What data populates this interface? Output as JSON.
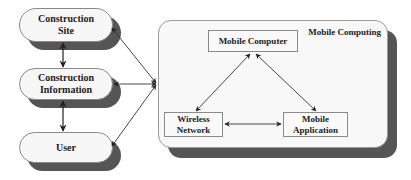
{
  "left_column": {
    "construction_site": {
      "line1": "Construction",
      "line2": "Site"
    },
    "construction_information": {
      "line1": "Construction",
      "line2": "Information"
    },
    "user": {
      "line1": "User"
    }
  },
  "mobile_computing": {
    "title": "Mobile Computing",
    "mobile_computer": {
      "label": "Mobile Computer"
    },
    "wireless_network": {
      "line1": "Wireless",
      "line2": "Network"
    },
    "mobile_application": {
      "line1": "Mobile",
      "line2": "Application"
    }
  },
  "connections": [
    {
      "from": "Construction Site",
      "to": "Construction Information",
      "type": "bidirectional"
    },
    {
      "from": "Construction Information",
      "to": "User",
      "type": "bidirectional"
    },
    {
      "from": "Construction Site",
      "to": "Mobile Computing",
      "type": "bidirectional"
    },
    {
      "from": "Construction Information",
      "to": "Mobile Computing",
      "type": "bidirectional"
    },
    {
      "from": "User",
      "to": "Mobile Computing",
      "type": "bidirectional"
    },
    {
      "from": "Mobile Computer",
      "to": "Wireless Network",
      "type": "bidirectional"
    },
    {
      "from": "Mobile Computer",
      "to": "Mobile Application",
      "type": "bidirectional"
    },
    {
      "from": "Wireless Network",
      "to": "Mobile Application",
      "type": "bidirectional"
    }
  ],
  "colors": {
    "shadow": "#555555",
    "box_fill": "#f7f7f7",
    "border": "#8a8a8a",
    "text": "#222222",
    "arrow": "#333333"
  }
}
